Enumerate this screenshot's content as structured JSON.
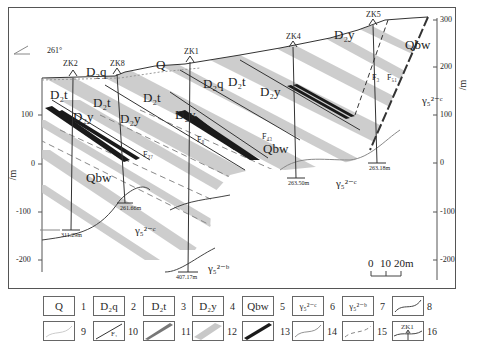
{
  "figure": {
    "type": "geological cross-section",
    "orientation_label": "261°",
    "vertical_axis": {
      "unit": "/m",
      "left_ticks": [
        "100",
        "0",
        "-100",
        "-200"
      ],
      "right_ticks": [
        "300",
        "200",
        "100",
        "0",
        "-100",
        "-200"
      ]
    },
    "scale_bar": {
      "ticks": [
        "0",
        "10",
        "20m"
      ]
    },
    "drill_holes": [
      {
        "id": "ZK2",
        "depth": "311.29m"
      },
      {
        "id": "ZK8",
        "depth": "261.66m"
      },
      {
        "id": "ZK1",
        "depth": "407.17m"
      },
      {
        "id": "ZK4",
        "depth": "263.50m"
      },
      {
        "id": "ZK5",
        "depth": "263.18m"
      }
    ],
    "unit_labels": {
      "Q": "Q",
      "D2q": "D₂q",
      "D2t": "D₂t",
      "D2y": "D₂y",
      "Qbw": "Qbw",
      "g2c": "γ₅²⁻ᶜ",
      "g2b": "γ₅²⁻ᵇ"
    },
    "faults": [
      "F₂₇",
      "F₈",
      "F₄₃",
      "F₃",
      "F₅₁"
    ]
  },
  "legend": {
    "row1": [
      {
        "n": "1",
        "symbol": "Q"
      },
      {
        "n": "2",
        "symbol": "D₂q"
      },
      {
        "n": "3",
        "symbol": "D₂t"
      },
      {
        "n": "4",
        "symbol": "D₂y"
      },
      {
        "n": "5",
        "symbol": "Qbw"
      },
      {
        "n": "6",
        "symbol": "γ₅²⁻ᶜ"
      },
      {
        "n": "7",
        "symbol": "γ₅²⁻ᵇ"
      },
      {
        "n": "8",
        "symbol": "curve-dark"
      }
    ],
    "row2": [
      {
        "n": "9",
        "symbol": "curve-light"
      },
      {
        "n": "10",
        "symbol": "fault-line",
        "label": "F₁"
      },
      {
        "n": "11",
        "symbol": "dark-band"
      },
      {
        "n": "12",
        "symbol": "gray-band"
      },
      {
        "n": "13",
        "symbol": "black-band"
      },
      {
        "n": "14",
        "symbol": "curve-thin"
      },
      {
        "n": "15",
        "symbol": "dashed-curve"
      },
      {
        "n": "16",
        "symbol": "drill-hole",
        "label": "ZK1"
      }
    ]
  },
  "colors": {
    "gray_band": "#c8c8c8",
    "black_band": "#1a1a1a",
    "line": "#333333"
  }
}
